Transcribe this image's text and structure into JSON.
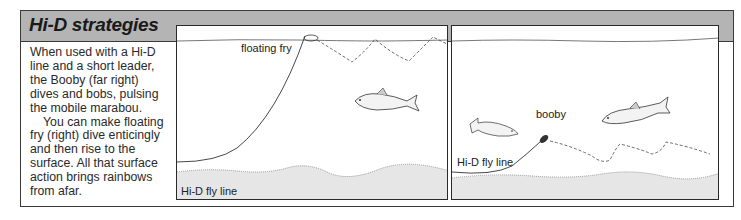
{
  "sidebar": {
    "title": "Hi-D strategies",
    "paragraphs": [
      "When used with a Hi-D line and a short leader, the Booby (far right) dives and bobs, pulsing the mobile marabou.",
      "You can make floating fry (right) dive enticingly and then rise to the surface. All that surface action brings rainbows from afar."
    ]
  },
  "illustrations": [
    {
      "name": "floating-fry-panel",
      "labels": {
        "fly": "floating fry",
        "line": "Hi-D fly line"
      }
    },
    {
      "name": "booby-panel",
      "labels": {
        "fly": "booby",
        "line": "Hi-D fly line"
      }
    }
  ],
  "colors": {
    "header_bg": "#b4b4b4",
    "border": "#3a3a3a",
    "text": "#2a2a2a"
  }
}
